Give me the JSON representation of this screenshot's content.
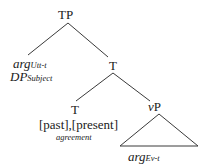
{
  "diagram": {
    "type": "syntax-tree",
    "nodes": {
      "root": {
        "label": "TP"
      },
      "spec": {
        "line1": {
          "main": "arg",
          "sub": "Utt-t"
        },
        "line2": {
          "main": "DP",
          "sub": "Subject"
        }
      },
      "t_bar": {
        "label": "T"
      },
      "t_head": {
        "label": "T",
        "features": "[past],[present]",
        "note": "agreement"
      },
      "vp": {
        "prefix": "v",
        "label": "P"
      },
      "vp_content": {
        "main": "arg",
        "sub": "Ev-t"
      }
    },
    "edges": [
      {
        "from": "TP",
        "to": "argUtt-t / DPSubject"
      },
      {
        "from": "TP",
        "to": "T"
      },
      {
        "from": "T",
        "to": "T [past],[present]"
      },
      {
        "from": "T",
        "to": "vP"
      }
    ],
    "colors": {
      "line": "#3a3a3a",
      "text": "#1a1a1a",
      "background": "#ffffff"
    }
  }
}
